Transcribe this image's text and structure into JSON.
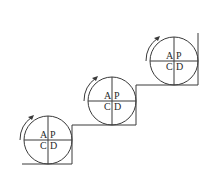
{
  "diagram": {
    "type": "pdca-staircase",
    "colors": {
      "line": "#3a3a3a",
      "text": "#2a2a2a",
      "background": "#ffffff"
    },
    "cycles": [
      {
        "quadrants": {
          "top_left": "A",
          "top_right": "P",
          "bottom_left": "C",
          "bottom_right": "D"
        },
        "rotation": "clockwise"
      },
      {
        "quadrants": {
          "top_left": "A",
          "top_right": "P",
          "bottom_left": "C",
          "bottom_right": "D"
        },
        "rotation": "clockwise"
      },
      {
        "quadrants": {
          "top_left": "A",
          "top_right": "P",
          "bottom_left": "C",
          "bottom_right": "D"
        },
        "rotation": "clockwise"
      }
    ]
  }
}
